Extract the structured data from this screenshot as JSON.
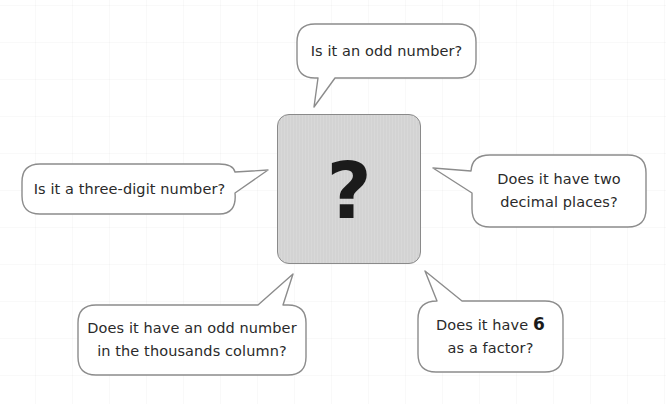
{
  "center": {
    "symbol": "?",
    "fill_color": "#d3d3d3",
    "border_color": "#8a8a8a"
  },
  "bubbles": [
    {
      "id": "top",
      "text": "Is it an odd number?"
    },
    {
      "id": "left",
      "text": "Is it a three-digit number?"
    },
    {
      "id": "right",
      "line1": "Does it have two",
      "line2": "decimal places?"
    },
    {
      "id": "bottom-left",
      "line1": "Does it have an odd number",
      "line2": "in the thousands column?"
    },
    {
      "id": "bottom-right",
      "line1_prefix": "Does it have ",
      "line1_bold": "6",
      "line2": "as a factor?"
    }
  ],
  "style": {
    "bubble_border": "#8c8c8c",
    "bubble_fill": "#ffffff",
    "text_color": "#2a2a2a"
  }
}
